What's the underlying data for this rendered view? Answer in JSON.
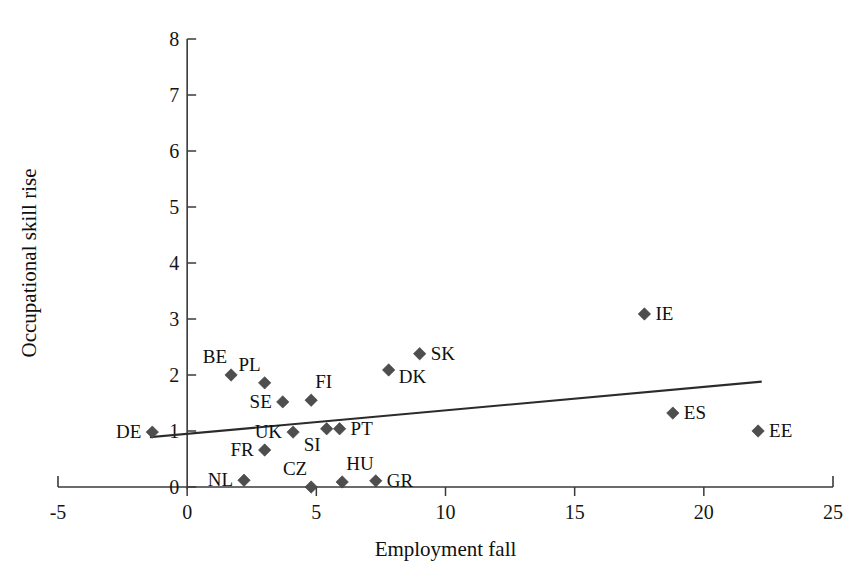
{
  "chart_data": {
    "type": "scatter",
    "title": "",
    "xlabel": "Employment fall",
    "ylabel": "Occupational skill rise",
    "xlim": [
      -5,
      25
    ],
    "ylim": [
      0,
      8
    ],
    "xticks": [
      -5,
      0,
      5,
      10,
      15,
      20,
      25
    ],
    "yticks": [
      0,
      1,
      2,
      3,
      4,
      5,
      6,
      7,
      8
    ],
    "xtick_labels": [
      "-5",
      "0",
      "5",
      "10",
      "15",
      "20",
      "25"
    ],
    "ytick_labels": [
      "0",
      "1",
      "2",
      "3",
      "4",
      "5",
      "6",
      "7",
      "8"
    ],
    "grid": false,
    "legend": false,
    "marker_shape": "diamond",
    "marker_color": "#4e4e4e",
    "series": [
      {
        "name": "EU countries",
        "points": [
          {
            "label": "DE",
            "x": -1.35,
            "y": 0.98,
            "label_pos": "left"
          },
          {
            "label": "BE",
            "x": 1.7,
            "y": 2.0,
            "label_pos": "upper-left"
          },
          {
            "label": "NL",
            "x": 2.2,
            "y": 0.12,
            "label_pos": "left"
          },
          {
            "label": "PL",
            "x": 3.0,
            "y": 1.86,
            "label_pos": "upper-left"
          },
          {
            "label": "FR",
            "x": 3.0,
            "y": 0.66,
            "label_pos": "left"
          },
          {
            "label": "SE",
            "x": 3.7,
            "y": 1.52,
            "label_pos": "left"
          },
          {
            "label": "UK",
            "x": 4.1,
            "y": 0.98,
            "label_pos": "left"
          },
          {
            "label": "FI",
            "x": 4.8,
            "y": 1.55,
            "label_pos": "upper-right"
          },
          {
            "label": "CZ",
            "x": 4.8,
            "y": 0.0,
            "label_pos": "upper-left"
          },
          {
            "label": "SI",
            "x": 5.4,
            "y": 1.04,
            "label_pos": "below-left"
          },
          {
            "label": "PT",
            "x": 5.9,
            "y": 1.04,
            "label_pos": "right"
          },
          {
            "label": "HU",
            "x": 6.0,
            "y": 0.09,
            "label_pos": "upper-right"
          },
          {
            "label": "GR",
            "x": 7.3,
            "y": 0.11,
            "label_pos": "right"
          },
          {
            "label": "DK",
            "x": 7.8,
            "y": 2.09,
            "label_pos": "lower-right"
          },
          {
            "label": "SK",
            "x": 9.0,
            "y": 2.38,
            "label_pos": "right"
          },
          {
            "label": "IE",
            "x": 17.7,
            "y": 3.09,
            "label_pos": "right"
          },
          {
            "label": "ES",
            "x": 18.8,
            "y": 1.32,
            "label_pos": "right"
          },
          {
            "label": "EE",
            "x": 22.1,
            "y": 1.0,
            "label_pos": "right"
          }
        ]
      }
    ],
    "trendline": {
      "type": "linear",
      "x_start": -1.4,
      "y_start": 0.89,
      "x_end": 22.2,
      "y_end": 1.88
    },
    "colors": {
      "marker": "#4e4e4e",
      "axis": "#3a3a3a",
      "trend": "#2b2b2b",
      "text": "#101010",
      "background": "#ffffff"
    }
  }
}
